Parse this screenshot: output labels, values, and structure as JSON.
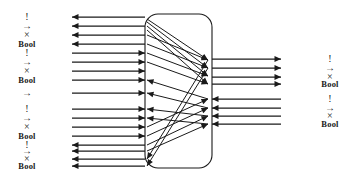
{
  "figure": {
    "type": "signal-flow-diagram",
    "width": 357,
    "height": 181,
    "background_color": "#ffffff",
    "stroke_color": "#1a1a1a"
  },
  "box": {
    "name": "central-component",
    "x": 145,
    "y": 14,
    "width": 67,
    "height": 154,
    "corner_radius": 13,
    "stroke_color": "#1a1a1a",
    "stroke_width": 1.1
  },
  "left_labels": [
    {
      "text": "!",
      "x": 27,
      "y": 23,
      "kind": "sym"
    },
    {
      "text": "→",
      "x": 27,
      "y": 36,
      "kind": "sym"
    },
    {
      "text": "×",
      "x": 27,
      "y": 49,
      "kind": "sym"
    },
    {
      "text": "Bool",
      "x": 27,
      "y": 62,
      "kind": "word"
    },
    {
      "text": "!",
      "x": 27,
      "y": 75,
      "kind": "sym"
    },
    {
      "text": "→",
      "x": 27,
      "y": 88,
      "kind": "sym"
    },
    {
      "text": "×",
      "x": 27,
      "y": 101,
      "kind": "sym"
    },
    {
      "text": "Bool",
      "x": 27,
      "y": 114,
      "kind": "word"
    },
    {
      "text": "→",
      "x": 27,
      "y": 136,
      "kind": "sym"
    },
    {
      "text": "!",
      "x": 27,
      "y": 160,
      "kind": "sym"
    },
    {
      "text": "→",
      "x": 27,
      "y": 173,
      "kind": "sym"
    },
    {
      "text": "×",
      "x": 27,
      "y": 186,
      "kind": "sym"
    },
    {
      "text": "Bool",
      "x": 27,
      "y": 199,
      "kind": "word"
    },
    {
      "text": "!",
      "x": 27,
      "y": 212,
      "kind": "sym"
    },
    {
      "text": "→",
      "x": 27,
      "y": 225,
      "kind": "sym"
    },
    {
      "text": "×",
      "x": 27,
      "y": 238,
      "kind": "sym"
    },
    {
      "text": "Bool",
      "x": 27,
      "y": 251,
      "kind": "word"
    }
  ],
  "right_labels": [
    {
      "text": "!",
      "x": 330,
      "y": 59,
      "kind": "sym"
    },
    {
      "text": "→",
      "x": 330,
      "y": 72,
      "kind": "sym"
    },
    {
      "text": "×",
      "x": 330,
      "y": 85,
      "kind": "sym"
    },
    {
      "text": "Bool",
      "x": 330,
      "y": 98,
      "kind": "word"
    },
    {
      "text": "!",
      "x": 330,
      "y": 124,
      "kind": "sym"
    },
    {
      "text": "→",
      "x": 330,
      "y": 137,
      "kind": "sym"
    },
    {
      "text": "×",
      "x": 330,
      "y": 150,
      "kind": "sym"
    },
    {
      "text": "Bool",
      "x": 330,
      "y": 163,
      "kind": "word"
    }
  ],
  "left_wires": [
    {
      "y": 17,
      "direction": "left",
      "x_outer": 72,
      "x_inner": 145
    },
    {
      "y": 26,
      "direction": "left",
      "x_outer": 72,
      "x_inner": 145
    },
    {
      "y": 35,
      "direction": "left",
      "x_outer": 72,
      "x_inner": 145
    },
    {
      "y": 44,
      "direction": "left",
      "x_outer": 72,
      "x_inner": 145
    },
    {
      "y": 53,
      "direction": "right",
      "x_outer": 72,
      "x_inner": 145
    },
    {
      "y": 62,
      "direction": "right",
      "x_outer": 72,
      "x_inner": 145
    },
    {
      "y": 71,
      "direction": "right",
      "x_outer": 72,
      "x_inner": 145
    },
    {
      "y": 80,
      "direction": "right",
      "x_outer": 72,
      "x_inner": 145
    },
    {
      "y": 93,
      "direction": "right",
      "x_outer": 72,
      "x_inner": 145
    },
    {
      "y": 109,
      "direction": "right",
      "x_outer": 72,
      "x_inner": 145
    },
    {
      "y": 118,
      "direction": "right",
      "x_outer": 72,
      "x_inner": 145
    },
    {
      "y": 127,
      "direction": "right",
      "x_outer": 72,
      "x_inner": 145
    },
    {
      "y": 136,
      "direction": "right",
      "x_outer": 72,
      "x_inner": 145
    },
    {
      "y": 145,
      "direction": "left",
      "x_outer": 72,
      "x_inner": 145
    },
    {
      "y": 151,
      "direction": "left",
      "x_outer": 72,
      "x_inner": 145
    },
    {
      "y": 159,
      "direction": "left",
      "x_outer": 72,
      "x_inner": 145
    },
    {
      "y": 166,
      "direction": "left",
      "x_outer": 72,
      "x_inner": 145
    }
  ],
  "right_wires": [
    {
      "y": 59,
      "direction": "right",
      "x_inner": 212,
      "x_outer": 281
    },
    {
      "y": 68,
      "direction": "right",
      "x_inner": 212,
      "x_outer": 281
    },
    {
      "y": 77,
      "direction": "right",
      "x_inner": 212,
      "x_outer": 281
    },
    {
      "y": 84,
      "direction": "right",
      "x_inner": 212,
      "x_outer": 281
    },
    {
      "y": 99,
      "direction": "left",
      "x_inner": 212,
      "x_outer": 281
    },
    {
      "y": 108,
      "direction": "left",
      "x_inner": 212,
      "x_outer": 281
    },
    {
      "y": 116,
      "direction": "left",
      "x_inner": 212,
      "x_outer": 281
    },
    {
      "y": 124,
      "direction": "left",
      "x_inner": 212,
      "x_outer": 281
    }
  ],
  "internal_wires": [
    {
      "x1": 147,
      "y1": 19,
      "x2": 208,
      "y2": 60,
      "arrow_at": "end"
    },
    {
      "x1": 147,
      "y1": 22,
      "x2": 208,
      "y2": 68,
      "arrow_at": "end"
    },
    {
      "x1": 147,
      "y1": 26,
      "x2": 208,
      "y2": 76,
      "arrow_at": "end"
    },
    {
      "x1": 147,
      "y1": 30,
      "x2": 208,
      "y2": 84,
      "arrow_at": "end"
    },
    {
      "x1": 147,
      "y1": 35,
      "x2": 208,
      "y2": 60,
      "arrow_at": "end"
    },
    {
      "x1": 147,
      "y1": 44,
      "x2": 208,
      "y2": 68,
      "arrow_at": "end"
    },
    {
      "x1": 147,
      "y1": 53,
      "x2": 208,
      "y2": 76,
      "arrow_at": "end"
    },
    {
      "x1": 147,
      "y1": 62,
      "x2": 208,
      "y2": 84,
      "arrow_at": "end"
    },
    {
      "x1": 208,
      "y1": 99,
      "x2": 147,
      "y2": 80,
      "arrow_at": "end"
    },
    {
      "x1": 208,
      "y1": 108,
      "x2": 147,
      "y2": 93,
      "arrow_at": "end"
    },
    {
      "x1": 208,
      "y1": 116,
      "x2": 147,
      "y2": 109,
      "arrow_at": "end"
    },
    {
      "x1": 208,
      "y1": 124,
      "x2": 147,
      "y2": 118,
      "arrow_at": "end"
    },
    {
      "x1": 147,
      "y1": 127,
      "x2": 208,
      "y2": 99,
      "arrow_at": "end"
    },
    {
      "x1": 147,
      "y1": 136,
      "x2": 208,
      "y2": 108,
      "arrow_at": "end"
    },
    {
      "x1": 147,
      "y1": 145,
      "x2": 208,
      "y2": 116,
      "arrow_at": "end"
    },
    {
      "x1": 147,
      "y1": 151,
      "x2": 208,
      "y2": 124,
      "arrow_at": "end"
    },
    {
      "x1": 208,
      "y1": 60,
      "x2": 147,
      "y2": 159,
      "arrow_at": "end"
    },
    {
      "x1": 208,
      "y1": 68,
      "x2": 147,
      "y2": 166,
      "arrow_at": "end"
    }
  ]
}
